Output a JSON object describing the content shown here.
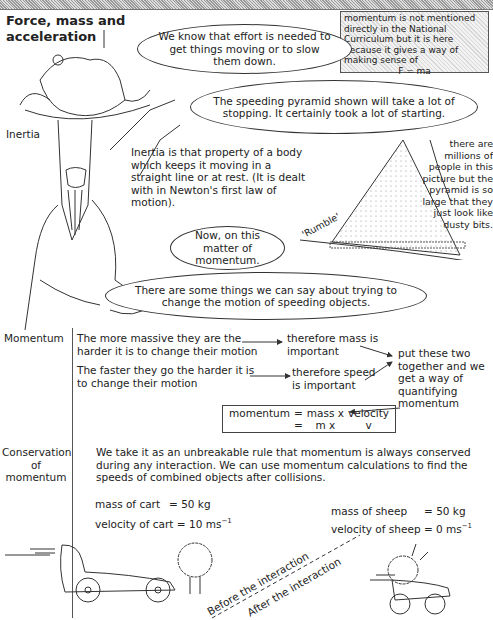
{
  "header": {
    "title_line1": "Force, mass and",
    "title_line2": "acceleration"
  },
  "side_note": {
    "text": "momentum is not mentioned directly in the National Curriculum but it is here because it gives a way of making sense of",
    "formula": "F = ma"
  },
  "bubbles": {
    "effort": "We know that effort is needed to get things moving or to slow them down.",
    "pyramid": "The speeding pyramid shown will take a lot of stopping. It certainly took a lot of starting.",
    "now": "Now, on this matter of momentum.",
    "things": "There are some things we can say about trying to change the motion of speeding objects."
  },
  "inertia": {
    "label": "Inertia",
    "definition": "Inertia is that property of a body which keeps it moving in a straight line or at rest. (It is dealt with in Newton's first law of motion)."
  },
  "pyramid_caption": "there are millions of people in this picture but the pyramid is so large that they just look like dusty bits.",
  "rumble": "'Rumble'",
  "momentum": {
    "label": "Momentum",
    "row1_left": "The more massive they are the harder it is to change their motion",
    "row1_right": "therefore mass is important",
    "row2_left": "The faster they go the harder it is to change their motion",
    "row2_right": "therefore speed is important",
    "together": "put these two together and we get a way of quantifying momentum",
    "formula": {
      "r1": [
        "momentum",
        "=",
        "mass x",
        "velocity"
      ],
      "r2": [
        "",
        "=",
        "m  x",
        "v"
      ]
    }
  },
  "conservation": {
    "label_line1": "Conservation",
    "label_line2": "of",
    "label_line3": "momentum",
    "text": "We take it as an unbreakable rule that momentum is always conserved during any interaction.  We can use momentum calculations to find the speeds of combined objects after collisions."
  },
  "cart": {
    "mass_label": "mass of cart",
    "mass_value": "=  50  kg",
    "vel_label": "velocity of cart",
    "vel_value": "= 10 ms",
    "vel_exp": "−1"
  },
  "sheep": {
    "mass_label": "mass of sheep",
    "mass_value": "=  50  kg",
    "vel_label": "velocity of sheep",
    "vel_value": "=   0  ms",
    "vel_exp": "−1"
  },
  "interaction": {
    "before": "Before the interaction",
    "after": "After the interaction"
  }
}
